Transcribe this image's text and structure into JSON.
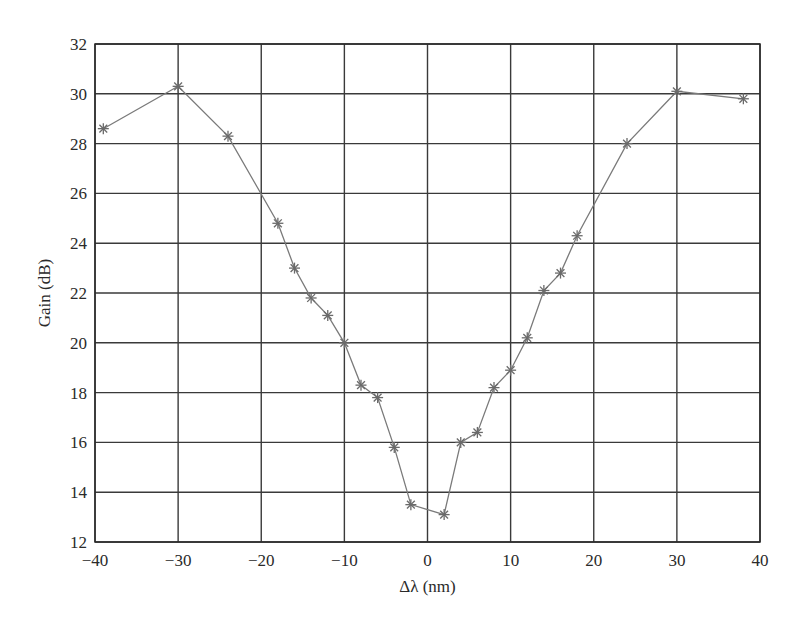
{
  "chart_data": {
    "type": "line",
    "title": "",
    "xlabel": "Δλ (nm)",
    "ylabel": "Gain (dB)",
    "xlim": [
      -40,
      40
    ],
    "ylim": [
      12,
      32
    ],
    "xticks": [
      -40,
      -30,
      -20,
      -10,
      0,
      10,
      20,
      30,
      40
    ],
    "yticks": [
      12,
      14,
      16,
      18,
      20,
      22,
      24,
      26,
      28,
      30,
      32
    ],
    "xtick_labels": [
      "−40",
      "−30",
      "−20",
      "−10",
      "0",
      "10",
      "20",
      "30",
      "40"
    ],
    "ytick_labels": [
      "12",
      "14",
      "16",
      "18",
      "20",
      "22",
      "24",
      "26",
      "28",
      "30",
      "32"
    ],
    "grid": true,
    "legend": null,
    "marker": "asterisk",
    "series": [
      {
        "name": "Gain",
        "x": [
          -39,
          -30,
          -24,
          -18,
          -16,
          -14,
          -12,
          -10,
          -8,
          -6,
          -4,
          -2,
          2,
          4,
          6,
          8,
          10,
          12,
          14,
          16,
          18,
          24,
          30,
          38
        ],
        "values": [
          28.6,
          30.3,
          28.3,
          24.8,
          23.0,
          21.8,
          21.1,
          20.0,
          18.3,
          17.8,
          15.8,
          13.5,
          13.1,
          16.0,
          16.4,
          18.2,
          18.9,
          20.2,
          22.1,
          22.8,
          24.3,
          28.0,
          30.1,
          29.8
        ]
      }
    ]
  },
  "style": {
    "line_color": "#7a7a7a",
    "marker_color": "#6a6a6a",
    "grid_color": "#3a3a3a",
    "frame_color": "#2a2a2a"
  }
}
